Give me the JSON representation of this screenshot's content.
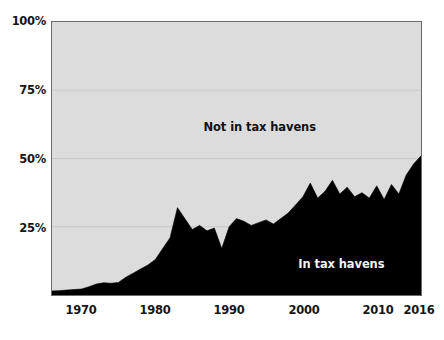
{
  "chart_data": {
    "type": "area",
    "title": "",
    "subtitle": "",
    "xlabel": "",
    "ylabel": "",
    "xlim": [
      1966,
      2016
    ],
    "ylim": [
      0,
      100
    ],
    "grid": true,
    "grid_axis": "y",
    "legend_position": "inline-annotation",
    "stacked": true,
    "y_unit": "%",
    "yticks": [
      {
        "value": 100,
        "label": "100%"
      },
      {
        "value": 75,
        "label": "75%"
      },
      {
        "value": 50,
        "label": "50%"
      },
      {
        "value": 25,
        "label": "25%"
      }
    ],
    "xticks": [
      {
        "value": 1970,
        "label": "1970"
      },
      {
        "value": 1980,
        "label": "1980"
      },
      {
        "value": 1990,
        "label": "1990"
      },
      {
        "value": 2000,
        "label": "2000"
      },
      {
        "value": 2010,
        "label": "2010"
      },
      {
        "value": 2016,
        "label": "2016"
      }
    ],
    "annotations": [
      {
        "text": "Not in tax havens",
        "x": 1994,
        "y": 62,
        "color": "#101010"
      },
      {
        "text": "In tax havens",
        "x": 2005,
        "y": 12,
        "color": "#f2f2f2"
      }
    ],
    "series": [
      {
        "name": "In tax havens",
        "color": "#000000",
        "text_color": "#f2f2f2",
        "x": [
          1966,
          1967,
          1968,
          1969,
          1970,
          1971,
          1972,
          1973,
          1974,
          1975,
          1976,
          1977,
          1978,
          1979,
          1980,
          1981,
          1982,
          1983,
          1984,
          1985,
          1986,
          1987,
          1988,
          1989,
          1990,
          1991,
          1992,
          1993,
          1994,
          1995,
          1996,
          1997,
          1998,
          1999,
          2000,
          2001,
          2002,
          2003,
          2004,
          2005,
          2006,
          2007,
          2008,
          2009,
          2010,
          2011,
          2012,
          2013,
          2014,
          2015,
          2016
        ],
        "values": [
          1.5,
          1.6,
          1.8,
          2.0,
          2.2,
          3.0,
          4.0,
          4.5,
          4.3,
          4.6,
          6.5,
          8.0,
          9.5,
          11.0,
          13.0,
          17.0,
          21.0,
          32.0,
          28.0,
          24.0,
          25.5,
          23.5,
          24.5,
          17.0,
          25.0,
          28.0,
          27.0,
          25.5,
          26.5,
          27.5,
          26.0,
          28.0,
          30.0,
          33.0,
          36.0,
          41.0,
          35.5,
          38.0,
          42.0,
          37.0,
          39.5,
          36.0,
          37.5,
          35.5,
          40.0,
          35.0,
          40.5,
          37.0,
          44.0,
          48.0,
          51.0
        ]
      },
      {
        "name": "Not in tax havens",
        "color": "#dcdcdc",
        "text_color": "#101010",
        "x": [
          1966,
          1967,
          1968,
          1969,
          1970,
          1971,
          1972,
          1973,
          1974,
          1975,
          1976,
          1977,
          1978,
          1979,
          1980,
          1981,
          1982,
          1983,
          1984,
          1985,
          1986,
          1987,
          1988,
          1989,
          1990,
          1991,
          1992,
          1993,
          1994,
          1995,
          1996,
          1997,
          1998,
          1999,
          2000,
          2001,
          2002,
          2003,
          2004,
          2005,
          2006,
          2007,
          2008,
          2009,
          2010,
          2011,
          2012,
          2013,
          2014,
          2015,
          2016
        ],
        "values": [
          98.5,
          98.4,
          98.2,
          98.0,
          97.8,
          97.0,
          96.0,
          95.5,
          95.7,
          95.4,
          93.5,
          92.0,
          90.5,
          89.0,
          87.0,
          83.0,
          79.0,
          68.0,
          72.0,
          76.0,
          74.5,
          76.5,
          75.5,
          83.0,
          75.0,
          72.0,
          73.0,
          74.5,
          73.5,
          72.5,
          74.0,
          72.0,
          70.0,
          67.0,
          64.0,
          59.0,
          64.5,
          62.0,
          58.0,
          63.0,
          60.5,
          64.0,
          62.5,
          64.5,
          60.0,
          65.0,
          59.5,
          63.0,
          56.0,
          52.0,
          49.0
        ]
      }
    ]
  },
  "colors": {
    "plot_background": "#dcdcdc",
    "page_background": "#ffffff",
    "axis_line": "#6b6b6b",
    "gridline": "#c7c7c7",
    "series_filled": "#000000",
    "tick_text": "#151515"
  }
}
